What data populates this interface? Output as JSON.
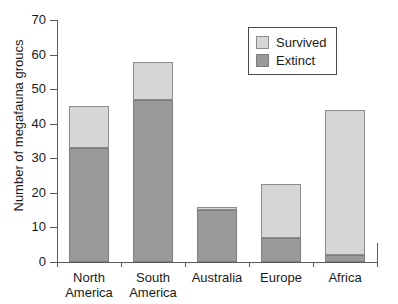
{
  "chart_data": {
    "type": "bar",
    "stacked": true,
    "title": "",
    "xlabel": "",
    "ylabel": "Number of megafauna groucs",
    "ylim": [
      0,
      70
    ],
    "yticks": [
      0,
      10,
      20,
      30,
      40,
      50,
      60,
      70
    ],
    "grid": false,
    "legend_position": "top-right",
    "categories": [
      "North America",
      "South America",
      "Australia",
      "Europe",
      "Africa"
    ],
    "category_lines": [
      [
        "North",
        "America"
      ],
      [
        "South",
        "America"
      ],
      [
        "Australia",
        ""
      ],
      [
        "Europe",
        ""
      ],
      [
        "Africa",
        ""
      ]
    ],
    "series": [
      {
        "name": "Extinct",
        "color": "#9a9a9a",
        "values": [
          33,
          47,
          15,
          7,
          2
        ]
      },
      {
        "name": "Survived",
        "color": "#d6d6d6",
        "values": [
          12,
          11,
          1,
          15.5,
          42
        ]
      }
    ],
    "totals": [
      45,
      58,
      16,
      22.5,
      44
    ]
  },
  "legend": {
    "entries": [
      {
        "label": "Survived",
        "swatch": "light-gray-swatch"
      },
      {
        "label": "Extinct",
        "swatch": "dark-gray-swatch"
      }
    ]
  },
  "axis": {
    "y_tick_labels": [
      "70",
      "60",
      "50",
      "40",
      "30",
      "20",
      "10",
      "0"
    ],
    "y_title": "Number of megafauna groucs"
  }
}
